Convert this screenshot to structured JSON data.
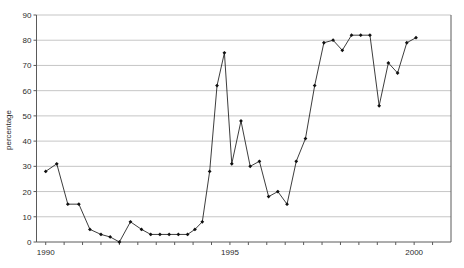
{
  "chart_data": {
    "type": "line",
    "title": "",
    "subtitle": "",
    "xlabel": "",
    "ylabel": "percentage",
    "xlim": [
      1989.75,
      2001.0
    ],
    "ylim": [
      0,
      90
    ],
    "ytick_step": 10,
    "yticks": [
      0,
      10,
      20,
      30,
      40,
      50,
      60,
      70,
      80,
      90
    ],
    "ytick_labels": [
      "0",
      "10",
      "20",
      "30",
      "40",
      "50",
      "60",
      "70",
      "80",
      "90"
    ],
    "xticks": [
      1990,
      1990.5,
      1991,
      1991.5,
      1992,
      1992.5,
      1993,
      1993.5,
      1994,
      1994.5,
      1995,
      1995.5,
      1996,
      1996.5,
      1997,
      1997.5,
      1998,
      1998.5,
      1999,
      1999.5,
      2000,
      2000.5
    ],
    "xtick_labels_shown": [
      "1990",
      "1995",
      "2000"
    ],
    "xtick_label_positions": [
      1990,
      1995,
      2000
    ],
    "grid": "horizontal",
    "legend": "none",
    "marker": "filled-diamond",
    "line_color": "#1a1a1a",
    "grid_color": "#aeaeae",
    "axis_color": "#5a5a5a",
    "series": [
      {
        "name": "percentage",
        "x": [
          1990.0,
          1990.3,
          1990.6,
          1990.9,
          1991.2,
          1991.5,
          1991.75,
          1992.0,
          1992.3,
          1992.6,
          1992.85,
          1993.1,
          1993.35,
          1993.6,
          1993.85,
          1994.05,
          1994.25,
          1994.45,
          1994.65,
          1994.85,
          1995.05,
          1995.3,
          1995.55,
          1995.8,
          1996.05,
          1996.3,
          1996.55,
          1996.8,
          1997.05,
          1997.3,
          1997.55,
          1997.8,
          1998.05,
          1998.3,
          1998.55,
          1998.8,
          1999.05,
          1999.3,
          1999.55,
          1999.8,
          2000.05
        ],
        "values": [
          28,
          31,
          15,
          15,
          5,
          3,
          2,
          0,
          8,
          5,
          3,
          3,
          3,
          3,
          3,
          5,
          8,
          28,
          62,
          75,
          31,
          48,
          30,
          32,
          18,
          20,
          15,
          32,
          41,
          62,
          79,
          80,
          76,
          82,
          82,
          82,
          54,
          71,
          67,
          79,
          81
        ]
      }
    ]
  },
  "axis": {
    "y_title": "percentage"
  }
}
